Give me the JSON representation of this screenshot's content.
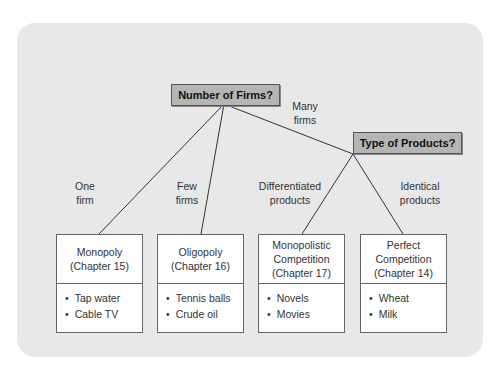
{
  "root_question": "Number of Firms?",
  "sub_question": "Type of Products?",
  "branch_labels": {
    "one": [
      "One",
      "firm"
    ],
    "few": [
      "Few",
      "firms"
    ],
    "many": [
      "Many",
      "firms"
    ],
    "differentiated": [
      "Differentiated",
      "products"
    ],
    "identical": [
      "Identical",
      "products"
    ]
  },
  "markets": [
    {
      "title": [
        "Monopoly",
        "(Chapter 15)"
      ],
      "examples": [
        "Tap water",
        "Cable TV"
      ]
    },
    {
      "title": [
        "Oligopoly",
        "(Chapter 16)"
      ],
      "examples": [
        "Tennis balls",
        "Crude oil"
      ]
    },
    {
      "title": [
        "Monopolistic",
        "Competition",
        "(Chapter 17)"
      ],
      "examples": [
        "Novels",
        "Movies"
      ]
    },
    {
      "title": [
        "Perfect",
        "Competition",
        "(Chapter 14)"
      ],
      "examples": [
        "Wheat",
        "Milk"
      ]
    }
  ]
}
